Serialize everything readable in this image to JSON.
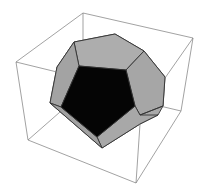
{
  "figure": {
    "type": "3d-polyhedron-render",
    "colors": {
      "background": "#ffffff",
      "box_edge": "#7a7a7a",
      "face_light": "#a9a9a9",
      "face_front": "#050505",
      "edge": "#333333"
    }
  }
}
